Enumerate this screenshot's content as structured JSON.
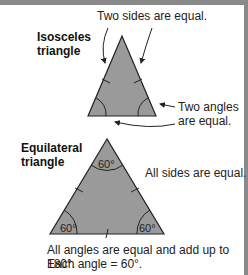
{
  "isosceles": {
    "title_line1": "Isosceles",
    "title_line2": "triangle",
    "sides_note": "Two sides are equal.",
    "angles_note_line1": "Two angles",
    "angles_note_line2": "are equal."
  },
  "equilateral": {
    "title_line1": "Equilateral",
    "title_line2": "triangle",
    "sides_note": "All sides are equal.",
    "angle_top": "60°",
    "angle_left": "60°",
    "angle_right": "60°",
    "footer_line1": "All angles are equal and add up to 180°.",
    "footer_line2": "Each angle = 60°."
  },
  "colors": {
    "fill": "#9a9a9a",
    "stroke": "#222222",
    "border": "#8a8a8a"
  }
}
